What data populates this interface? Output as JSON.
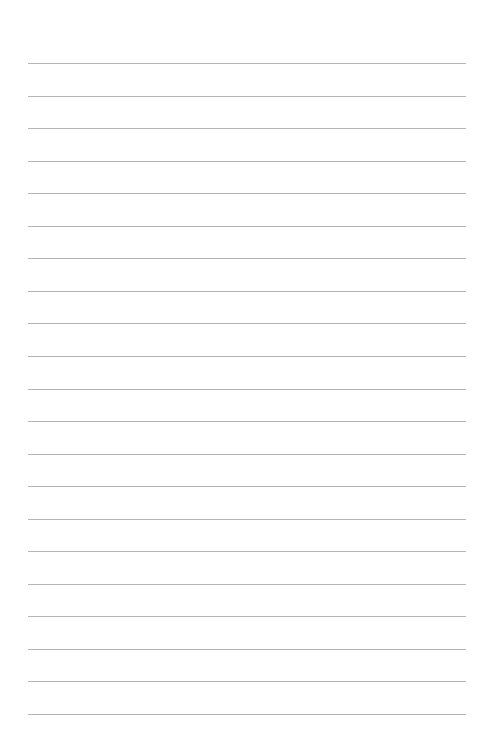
{
  "page": {
    "type": "lined-paper",
    "background_color": "#ffffff",
    "line_color": "#b4b4b4",
    "line_count": 21,
    "first_line_y": 63,
    "line_spacing": 32.55,
    "line_left": 28,
    "line_width": 438
  }
}
